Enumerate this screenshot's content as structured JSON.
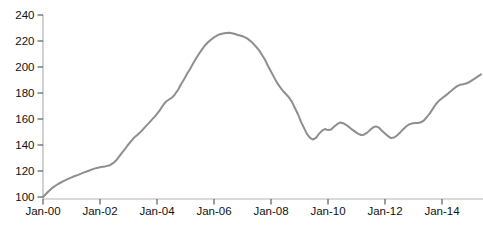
{
  "chart_data": {
    "type": "line",
    "title": "",
    "xlabel": "",
    "ylabel": "",
    "grid": false,
    "legend": "none",
    "background": "#ffffff",
    "line_color": "#8e8e8e",
    "axis_color": "#b3b3b3",
    "tick_color": "#595959",
    "label_color": "#111111",
    "xlim": [
      2000,
      2015.45
    ],
    "ylim": [
      100,
      240
    ],
    "y_ticks": [
      100,
      120,
      140,
      160,
      180,
      200,
      220,
      240
    ],
    "y_tick_labels": [
      "100",
      "120",
      "140",
      "160",
      "180",
      "200",
      "220",
      "240"
    ],
    "x_ticks": [
      2000,
      2002,
      2004,
      2006,
      2008,
      2010,
      2012,
      2014
    ],
    "x_tick_labels": [
      "Jan-00",
      "Jan-02",
      "Jan-04",
      "Jan-06",
      "Jan-08",
      "Jan-10",
      "Jan-12",
      "Jan-14"
    ],
    "series": [
      {
        "name": "index",
        "points": [
          [
            2000.0,
            100
          ],
          [
            2000.18,
            104
          ],
          [
            2000.35,
            107.5
          ],
          [
            2000.53,
            110
          ],
          [
            2000.7,
            112
          ],
          [
            2000.88,
            114
          ],
          [
            2001.05,
            115.5
          ],
          [
            2001.23,
            117
          ],
          [
            2001.4,
            118.5
          ],
          [
            2001.58,
            120
          ],
          [
            2001.75,
            121.5
          ],
          [
            2001.89,
            122.4
          ],
          [
            2002.04,
            123
          ],
          [
            2002.18,
            123.5
          ],
          [
            2002.35,
            124.5
          ],
          [
            2002.46,
            126
          ],
          [
            2002.56,
            128
          ],
          [
            2002.67,
            131
          ],
          [
            2002.77,
            134
          ],
          [
            2002.88,
            137
          ],
          [
            2002.98,
            140
          ],
          [
            2003.09,
            143
          ],
          [
            2003.19,
            145.5
          ],
          [
            2003.3,
            147.5
          ],
          [
            2003.4,
            149.5
          ],
          [
            2003.51,
            152
          ],
          [
            2003.61,
            154.5
          ],
          [
            2003.72,
            157
          ],
          [
            2003.82,
            159.5
          ],
          [
            2003.93,
            162
          ],
          [
            2004.0,
            164
          ],
          [
            2004.11,
            167
          ],
          [
            2004.21,
            170.5
          ],
          [
            2004.32,
            173.5
          ],
          [
            2004.42,
            175
          ],
          [
            2004.53,
            176.5
          ],
          [
            2004.63,
            179
          ],
          [
            2004.74,
            182.5
          ],
          [
            2004.84,
            186.5
          ],
          [
            2004.95,
            190.5
          ],
          [
            2005.05,
            194.5
          ],
          [
            2005.16,
            198.5
          ],
          [
            2005.26,
            202.5
          ],
          [
            2005.37,
            206.5
          ],
          [
            2005.47,
            210
          ],
          [
            2005.58,
            213.5
          ],
          [
            2005.68,
            216.5
          ],
          [
            2005.79,
            219
          ],
          [
            2005.89,
            221
          ],
          [
            2006.0,
            222.8
          ],
          [
            2006.11,
            224.2
          ],
          [
            2006.21,
            225.2
          ],
          [
            2006.32,
            225.8
          ],
          [
            2006.42,
            226.2
          ],
          [
            2006.53,
            226.3
          ],
          [
            2006.63,
            226
          ],
          [
            2006.74,
            225.4
          ],
          [
            2006.84,
            224.6
          ],
          [
            2006.95,
            224
          ],
          [
            2007.05,
            223.2
          ],
          [
            2007.16,
            222
          ],
          [
            2007.26,
            220.3
          ],
          [
            2007.37,
            218.2
          ],
          [
            2007.47,
            215.8
          ],
          [
            2007.58,
            213
          ],
          [
            2007.68,
            209.5
          ],
          [
            2007.79,
            205.5
          ],
          [
            2007.89,
            201
          ],
          [
            2008.0,
            196.5
          ],
          [
            2008.11,
            192
          ],
          [
            2008.21,
            188
          ],
          [
            2008.32,
            184.5
          ],
          [
            2008.42,
            181.5
          ],
          [
            2008.53,
            179
          ],
          [
            2008.63,
            176.5
          ],
          [
            2008.74,
            173
          ],
          [
            2008.84,
            168.5
          ],
          [
            2008.95,
            163.5
          ],
          [
            2009.05,
            158
          ],
          [
            2009.16,
            153
          ],
          [
            2009.26,
            148.5
          ],
          [
            2009.37,
            145.5
          ],
          [
            2009.47,
            144.2
          ],
          [
            2009.58,
            145.5
          ],
          [
            2009.68,
            148.5
          ],
          [
            2009.79,
            151
          ],
          [
            2009.89,
            152.3
          ],
          [
            2010.0,
            151.5
          ],
          [
            2010.11,
            152
          ],
          [
            2010.21,
            154
          ],
          [
            2010.32,
            156
          ],
          [
            2010.42,
            157.3
          ],
          [
            2010.53,
            156.8
          ],
          [
            2010.63,
            155.5
          ],
          [
            2010.74,
            153.8
          ],
          [
            2010.84,
            152
          ],
          [
            2010.95,
            150.3
          ],
          [
            2011.05,
            148.8
          ],
          [
            2011.16,
            147.7
          ],
          [
            2011.26,
            147.9
          ],
          [
            2011.37,
            149.3
          ],
          [
            2011.47,
            151.5
          ],
          [
            2011.58,
            153.5
          ],
          [
            2011.68,
            154.3
          ],
          [
            2011.79,
            153.3
          ],
          [
            2011.89,
            151
          ],
          [
            2012.0,
            148.8
          ],
          [
            2012.11,
            146.8
          ],
          [
            2012.21,
            145.3
          ],
          [
            2012.32,
            145.8
          ],
          [
            2012.42,
            147.3
          ],
          [
            2012.53,
            149.5
          ],
          [
            2012.63,
            152
          ],
          [
            2012.74,
            154.2
          ],
          [
            2012.84,
            155.8
          ],
          [
            2012.95,
            156.6
          ],
          [
            2013.05,
            156.9
          ],
          [
            2013.16,
            157
          ],
          [
            2013.26,
            157.5
          ],
          [
            2013.37,
            159
          ],
          [
            2013.47,
            161.5
          ],
          [
            2013.58,
            164.5
          ],
          [
            2013.68,
            168
          ],
          [
            2013.79,
            171.5
          ],
          [
            2013.89,
            174
          ],
          [
            2014.0,
            176
          ],
          [
            2014.11,
            177.8
          ],
          [
            2014.21,
            179.5
          ],
          [
            2014.32,
            181.5
          ],
          [
            2014.42,
            183.5
          ],
          [
            2014.53,
            185.3
          ],
          [
            2014.63,
            186.3
          ],
          [
            2014.74,
            186.8
          ],
          [
            2014.84,
            187.3
          ],
          [
            2014.95,
            188.3
          ],
          [
            2015.05,
            189.8
          ],
          [
            2015.16,
            191.3
          ],
          [
            2015.26,
            192.8
          ],
          [
            2015.37,
            194.3
          ]
        ]
      }
    ]
  }
}
